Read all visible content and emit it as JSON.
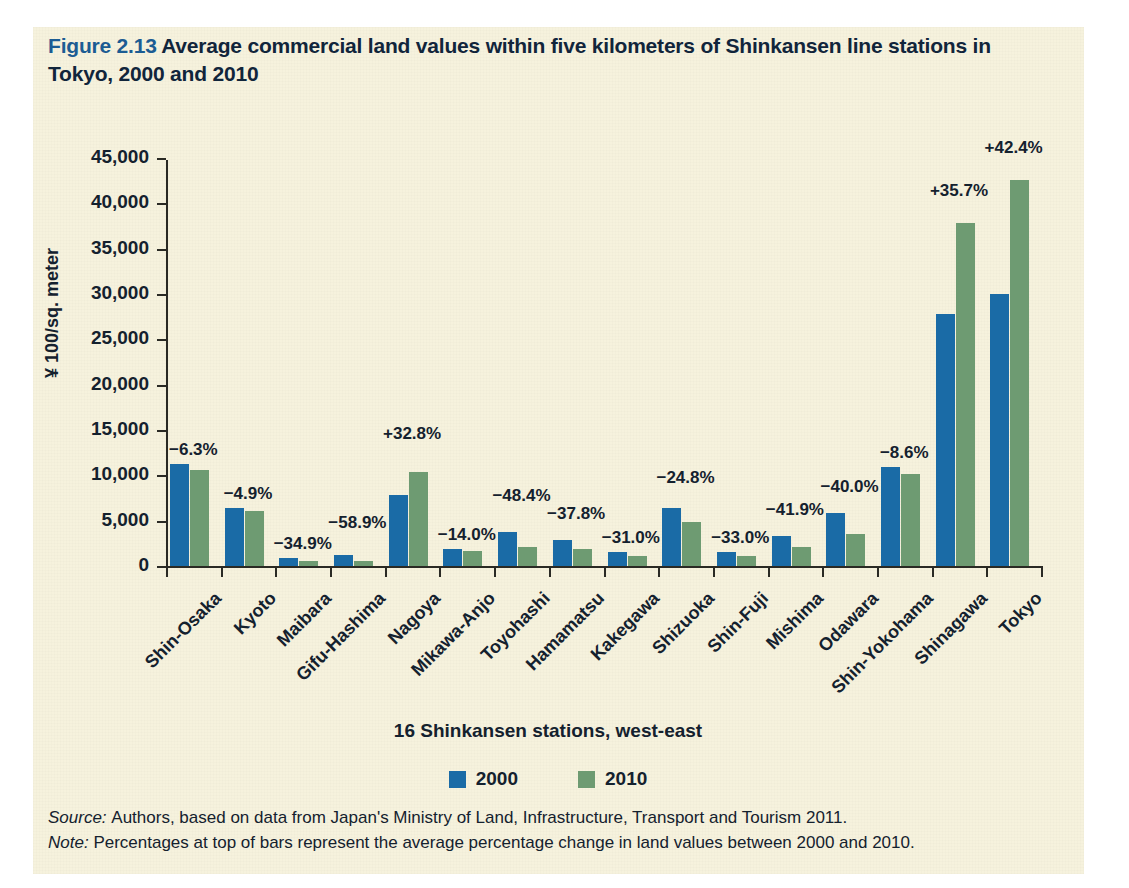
{
  "figure": {
    "number": "Figure 2.13",
    "title": "Average commercial land values within five kilometers of Shinkansen line stations in Tokyo, 2000 and 2010"
  },
  "notes": {
    "source_label": "Source:",
    "source_text": "Authors, based on data from Japan's Ministry of Land, Infrastructure, Transport  and Tourism 2011.",
    "note_label": "Note:",
    "note_text": "Percentages at top of bars represent the average percentage change in land values between 2000 and 2010."
  },
  "colors": {
    "series_2000": "#1a6ba6",
    "series_2010": "#6e9b72",
    "paper": "#f6f2dd",
    "title_accent": "#1c5c93",
    "ink": "#14212e"
  },
  "chart_data": {
    "type": "bar",
    "title": "Average commercial land values within five kilometers of Shinkansen line stations in Tokyo, 2000 and 2010",
    "xlabel": "16 Shinkansen stations, west-east",
    "ylabel": "¥ 100/sq. meter",
    "ylim": [
      0,
      45000
    ],
    "ytick_values": [
      0,
      5000,
      10000,
      15000,
      20000,
      25000,
      30000,
      35000,
      40000,
      45000
    ],
    "ytick_labels": [
      "0",
      "5,000",
      "10,000",
      "15,000",
      "20,000",
      "25,000",
      "30,000",
      "35,000",
      "40,000",
      "45,000"
    ],
    "grid": false,
    "legend_position": "bottom",
    "categories": [
      "Shin-Osaka",
      "Kyoto",
      "Maibara",
      "Gifu-Hashima",
      "Nagoya",
      "Mikawa-Anjo",
      "Toyohashi",
      "Hamamatsu",
      "Kakegawa",
      "Shizuoka",
      "Shin-Fuji",
      "Mishima",
      "Odawara",
      "Shin-Yokohama",
      "Shinagawa",
      "Tokyo"
    ],
    "series": [
      {
        "name": "2000",
        "color": "#1a6ba6",
        "values": [
          11250,
          6400,
          900,
          1250,
          7800,
          1900,
          3700,
          2900,
          1600,
          6400,
          1600,
          3300,
          5900,
          10950,
          27800,
          30000
        ]
      },
      {
        "name": "2010",
        "color": "#6e9b72",
        "values": [
          10600,
          6100,
          560,
          520,
          10350,
          1700,
          2050,
          1900,
          1150,
          4850,
          1150,
          2150,
          3550,
          10100,
          37800,
          42600
        ]
      }
    ],
    "annotations": [
      "−6.3%",
      "−4.9%",
      "−34.9%",
      "−58.9%",
      "+32.8%",
      "−14.0%",
      "−48.4%",
      "−37.8%",
      "−31.0%",
      "−24.8%",
      "−33.0%",
      "−41.9%",
      "−40.0%",
      "−8.6%",
      "+35.7%",
      "+42.4%"
    ],
    "annotation_offsets_px": [
      22,
      22,
      22,
      40,
      46,
      22,
      44,
      34,
      22,
      38,
      22,
      34,
      34,
      22,
      40,
      40
    ]
  }
}
